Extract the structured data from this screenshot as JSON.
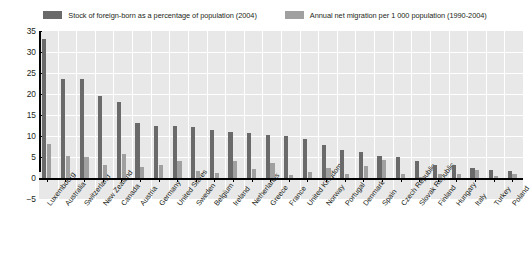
{
  "legend": {
    "entries": [
      {
        "label": "Stock of foreign-born as a percentage of population (2004)",
        "color": "#6a6a6a",
        "swatch_name": "legend-swatch-stock"
      },
      {
        "label": "Annual net migration per 1 000 population (1990-2004)",
        "color": "#a0a0a0",
        "swatch_name": "legend-swatch-migration"
      }
    ]
  },
  "chart_data": {
    "type": "bar",
    "title": "",
    "subtitle": "",
    "xlabel": "",
    "ylabel": "",
    "ylim": [
      -5,
      35
    ],
    "yticks": [
      -5,
      0,
      5,
      10,
      15,
      20,
      25,
      30,
      35
    ],
    "ytick_labels": [
      "−5",
      "0",
      "5",
      "10",
      "15",
      "20",
      "25",
      "30",
      "35"
    ],
    "grid": true,
    "legend_position": "top",
    "categories": [
      "Luxembourg",
      "Australia",
      "Switzerland",
      "New Zealand",
      "Canada",
      "Austria",
      "Germany",
      "United States",
      "Sweden",
      "Belgium",
      "Ireland",
      "Netherlands",
      "Greece",
      "France",
      "United Kingdom",
      "Norway",
      "Portugal",
      "Denmark",
      "Spain",
      "Czech Republic",
      "Slovak Republic",
      "Finland",
      "Hungary",
      "Italy",
      "Turkey",
      "Poland"
    ],
    "series": [
      {
        "name": "Stock of foreign-born as a percentage of population (2004)",
        "color": "#6a6a6a",
        "values": [
          33.0,
          23.6,
          23.5,
          19.5,
          18.0,
          13.0,
          12.5,
          12.4,
          12.2,
          11.4,
          11.0,
          10.6,
          10.3,
          10.0,
          9.3,
          7.8,
          6.7,
          6.3,
          5.3,
          4.9,
          4.0,
          3.1,
          3.0,
          2.5,
          1.9,
          1.6
        ],
        "unit": "% of population"
      },
      {
        "name": "Annual net migration per 1 000 population (1990-2004)",
        "color": "#a0a0a0",
        "values": [
          8.0,
          5.2,
          5.1,
          3.0,
          5.6,
          2.6,
          3.2,
          4.0,
          1.7,
          1.3,
          4.1,
          2.1,
          3.5,
          0.8,
          1.5,
          2.4,
          1.0,
          2.8,
          4.2,
          1.0,
          0.3,
          1.0,
          1.0,
          2.0,
          0.4,
          0.9
        ],
        "unit": "per 1 000 population"
      }
    ]
  }
}
